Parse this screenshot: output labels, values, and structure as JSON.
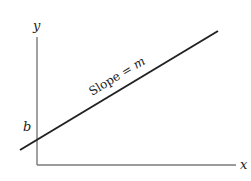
{
  "diagram": {
    "type": "linear-function-graph",
    "axes": {
      "x_label": "x",
      "y_label": "y"
    },
    "intercept_label": "b",
    "slope_label_text": "Slope = ",
    "slope_label_var": "m",
    "colors": {
      "axis": "#6e6e6e",
      "line": "#222222",
      "text": "#222222"
    }
  }
}
